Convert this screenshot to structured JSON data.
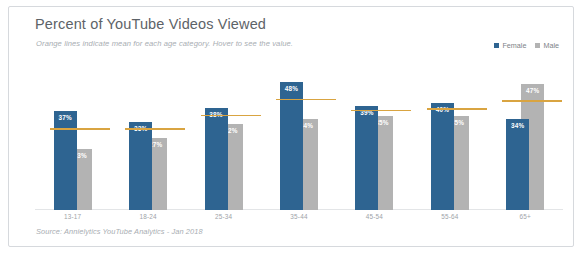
{
  "card": {
    "title": "Percent of YouTube Videos Viewed",
    "subtitle": "Orange lines indicate mean for each age category. Hover to see the value.",
    "source": "Source: Annielytics YouTube Analytics - Jan 2018"
  },
  "colors": {
    "female": "#2e6491",
    "male": "#b3b3b3",
    "mean_line": "#d9a441",
    "title_text": "#5d6368",
    "muted_text": "#a8adb2",
    "card_border": "#d6d9dd",
    "baseline": "#e3e5e7"
  },
  "legend": {
    "position": "top-right",
    "entries": [
      {
        "label": "Female",
        "color": "#2e6491"
      },
      {
        "label": "Male",
        "color": "#b3b3b3"
      }
    ]
  },
  "chart_data": {
    "type": "bar",
    "title": "Percent of YouTube Videos Viewed",
    "subtitle": "Orange lines indicate mean for each age category. Hover to see the value.",
    "xlabel": "",
    "ylabel": "",
    "ylim": [
      0,
      55
    ],
    "grid": false,
    "legend_position": "top-right",
    "categories": [
      "13-17",
      "18-24",
      "25-34",
      "35-44",
      "45-54",
      "55-64",
      "65+"
    ],
    "series": [
      {
        "name": "Female",
        "color": "#2e6491",
        "values": [
          37,
          33,
          38,
          48,
          39,
          40,
          34
        ],
        "labels": [
          "37%",
          "33%",
          "38%",
          "48%",
          "39%",
          "40%",
          "34%"
        ]
      },
      {
        "name": "Male",
        "color": "#b3b3b3",
        "values": [
          23,
          27,
          32,
          34,
          35,
          35,
          47
        ],
        "labels": [
          "23%",
          "27%",
          "32%",
          "34%",
          "35%",
          "35%",
          "47%"
        ]
      }
    ],
    "mean_values": [
      30,
      30,
      35,
      41,
      37,
      37.5,
      40.5
    ],
    "annotations": [
      "Orange lines indicate mean for each age category."
    ],
    "source": "Source: Annielytics YouTube Analytics - Jan 2018"
  }
}
